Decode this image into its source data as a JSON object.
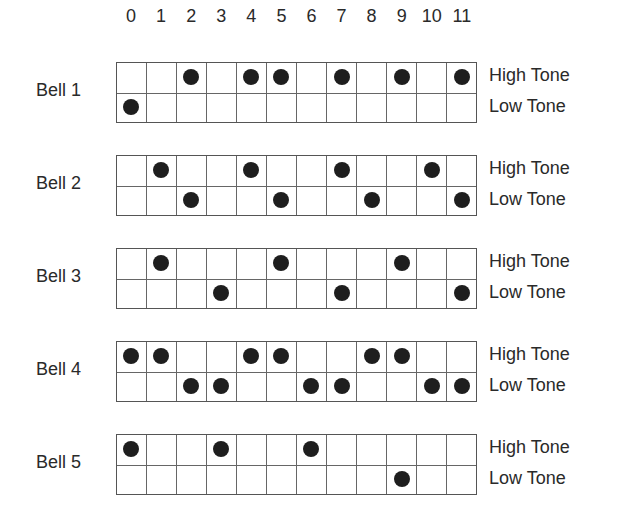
{
  "columns": [
    "0",
    "1",
    "2",
    "3",
    "4",
    "5",
    "6",
    "7",
    "8",
    "9",
    "10",
    "11"
  ],
  "row_labels": {
    "high": "High Tone",
    "low": "Low Tone"
  },
  "dot_color": "#1e1e1e",
  "bells": [
    {
      "label": "Bell 1",
      "top": 62,
      "high": [
        2,
        4,
        5,
        7,
        9,
        11
      ],
      "low": [
        0
      ]
    },
    {
      "label": "Bell 2",
      "top": 155,
      "high": [
        1,
        4,
        7,
        10
      ],
      "low": [
        2,
        5,
        8,
        11
      ]
    },
    {
      "label": "Bell 3",
      "top": 248,
      "high": [
        1,
        5,
        9
      ],
      "low": [
        3,
        7,
        11
      ]
    },
    {
      "label": "Bell 4",
      "top": 341,
      "high": [
        0,
        1,
        4,
        5,
        8,
        9
      ],
      "low": [
        2,
        3,
        6,
        7,
        10,
        11
      ]
    },
    {
      "label": "Bell 5",
      "top": 434,
      "high": [
        0,
        3,
        6
      ],
      "low": [
        9
      ]
    }
  ]
}
